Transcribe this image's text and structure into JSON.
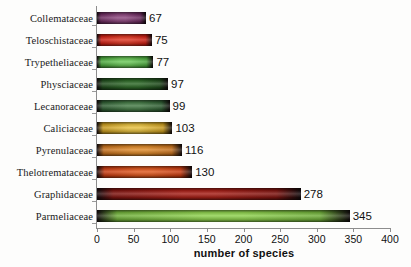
{
  "chart_data": {
    "type": "bar",
    "orientation": "horizontal",
    "title": "",
    "xlabel": "number of species",
    "ylabel": "",
    "xlim": [
      0,
      400
    ],
    "xticks": [
      0,
      50,
      100,
      150,
      200,
      250,
      300,
      350,
      400
    ],
    "grid": false,
    "legend": null,
    "categories": [
      "Collemataceae",
      "Teloschistaceae",
      "Trypetheliaceae",
      "Physciaceae",
      "Lecanoraceae",
      "Caliciaceae",
      "Pyrenulaceae",
      "Thelotremataceae",
      "Graphidaceae",
      "Parmeliaceae"
    ],
    "values": [
      67,
      75,
      77,
      97,
      99,
      103,
      116,
      130,
      278,
      345
    ],
    "value_labels": [
      "67",
      "75",
      "77",
      "97",
      "99",
      "103",
      "116",
      "130",
      "278",
      "345"
    ],
    "bar_colors": [
      "#6b2a5e",
      "#cc1f14",
      "#4aa63c",
      "#1f4a1c",
      "#2e5c32",
      "#c79a1e",
      "#c4701d",
      "#c73c12",
      "#7e1410",
      "#6fae3a"
    ],
    "bar_colors_light": [
      "#8f4a80",
      "#e03a26",
      "#6cc95a",
      "#2f6b29",
      "#477d48",
      "#e8c242",
      "#e08c2c",
      "#e05a20",
      "#a82018",
      "#8fd24f"
    ]
  },
  "axis": {
    "title": "number of species",
    "tick_labels": [
      "0",
      "50",
      "100",
      "150",
      "200",
      "250",
      "300",
      "350",
      "400"
    ]
  },
  "colors": {
    "background": "#fdfdfc",
    "axis_line": "#8d8d8d",
    "text": "#111111"
  }
}
